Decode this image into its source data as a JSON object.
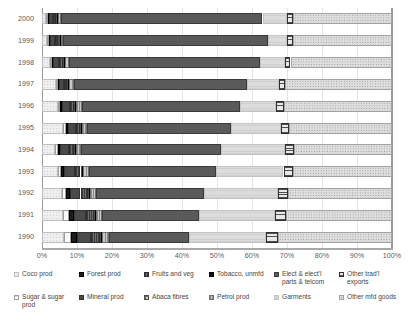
{
  "chart_data": {
    "type": "bar",
    "orientation": "horizontal",
    "stacked": true,
    "stack_mode": "percent",
    "title": "",
    "subtitle": "",
    "xlabel": "",
    "ylabel": "",
    "xlim": [
      0,
      100
    ],
    "xticks": [
      "0%",
      "10%",
      "20%",
      "30%",
      "40%",
      "50%",
      "60%",
      "70%",
      "80%",
      "90%",
      "100%"
    ],
    "xtick_values": [
      0,
      10,
      20,
      30,
      40,
      50,
      60,
      70,
      80,
      90,
      100
    ],
    "grid": true,
    "grid_axis": "x",
    "legend_position": "bottom",
    "legend_columns": 6,
    "categories": [
      "2000",
      "1999",
      "1998",
      "1997",
      "1996",
      "1995",
      "1994",
      "1993",
      "1992",
      "1991",
      "1990"
    ],
    "series": [
      {
        "name": "Coco prod",
        "key": "coco",
        "style": "coco",
        "values": [
          1.2,
          1.5,
          2.2,
          4.0,
          4.6,
          5.9,
          3.7,
          4.6,
          5.7,
          6.0,
          6.3
        ]
      },
      {
        "name": "Sugar & sugar prod",
        "key": "sugar",
        "style": "sugar",
        "values": [
          0.6,
          0.6,
          0.6,
          0.6,
          0.6,
          0.9,
          0.9,
          0.9,
          1.1,
          1.7,
          2.0
        ]
      },
      {
        "name": "Forest prod",
        "key": "forest",
        "style": "forest",
        "values": [
          0.3,
          0.3,
          0.3,
          0.3,
          0.6,
          0.6,
          0.6,
          0.9,
          1.1,
          1.4,
          1.7
        ]
      },
      {
        "name": "Mineral prod",
        "key": "mineral",
        "style": "mineral",
        "values": [
          1.1,
          1.4,
          1.7,
          1.4,
          2.3,
          2.3,
          2.6,
          2.9,
          3.1,
          3.4,
          4.0
        ]
      },
      {
        "name": "Fruits and veg",
        "key": "fruits",
        "style": "fruits",
        "values": [
          0.9,
          0.9,
          1.1,
          0.9,
          1.1,
          1.1,
          1.4,
          1.7,
          2.0,
          2.3,
          2.6
        ]
      },
      {
        "name": "Abaca fibres",
        "key": "abaca",
        "style": "abaca",
        "values": [
          0.3,
          0.3,
          0.3,
          0.3,
          0.3,
          0.3,
          0.3,
          0.3,
          0.3,
          0.3,
          0.3
        ]
      },
      {
        "name": "Tobacco, unmfd",
        "key": "tobacco",
        "style": "tobacco",
        "values": [
          0.3,
          0.3,
          0.3,
          0.3,
          0.3,
          0.3,
          0.3,
          0.3,
          0.3,
          0.3,
          0.3
        ]
      },
      {
        "name": "Petrol prod",
        "key": "petrol",
        "style": "petrol",
        "values": [
          0.6,
          0.6,
          1.1,
          1.4,
          1.7,
          1.4,
          1.4,
          1.7,
          1.7,
          1.7,
          2.0
        ]
      },
      {
        "name": "Elect & elect'l parts & telcom",
        "key": "elect",
        "style": "elect",
        "values": [
          57.7,
          58.6,
          54.6,
          49.4,
          45.1,
          41.1,
          40.0,
          36.3,
          31.1,
          27.7,
          22.9
        ]
      },
      {
        "name": "Garments",
        "key": "garments",
        "style": "garments",
        "values": [
          7.1,
          5.4,
          7.1,
          9.1,
          10.3,
          14.3,
          18.3,
          19.4,
          21.1,
          21.7,
          22.0
        ]
      },
      {
        "name": "Other trad'l exports",
        "key": "othertrad",
        "style": "othertrad",
        "values": [
          1.7,
          1.7,
          1.7,
          1.7,
          2.3,
          2.3,
          2.6,
          2.6,
          2.9,
          3.1,
          3.4
        ]
      },
      {
        "name": "Other mfd goods",
        "key": "othermfd",
        "style": "othermfd",
        "values": [
          28.2,
          28.4,
          29.0,
          30.6,
          30.8,
          29.5,
          27.9,
          28.4,
          29.6,
          30.4,
          32.5
        ]
      }
    ]
  },
  "axes": {
    "y_categories": [
      "2000",
      "1999",
      "1998",
      "1997",
      "1996",
      "1995",
      "1994",
      "1993",
      "1992",
      "1991",
      "1990"
    ],
    "x_ticks": [
      "0%",
      "10%",
      "20%",
      "30%",
      "40%",
      "50%",
      "60%",
      "70%",
      "80%",
      "90%",
      "100%"
    ]
  },
  "legend": {
    "items": [
      {
        "label": "Coco prod",
        "style": "coco"
      },
      {
        "label": "Sugar & sugar prod",
        "style": "sugar"
      },
      {
        "label": "Forest prod",
        "style": "forest"
      },
      {
        "label": "Mineral prod",
        "style": "mineral"
      },
      {
        "label": "Fruits and veg",
        "style": "fruits"
      },
      {
        "label": "Abaca fibres",
        "style": "abaca"
      },
      {
        "label": "Tobacco, unmfd",
        "style": "tobacco"
      },
      {
        "label": "Petrol prod",
        "style": "petrol"
      },
      {
        "label": "Elect & elect'l parts & telcom",
        "style": "elect"
      },
      {
        "label": "Garments",
        "style": "garments"
      },
      {
        "label": "Other trad'l exports",
        "style": "othertrad"
      },
      {
        "label": "Other mfd goods",
        "style": "othermfd"
      }
    ]
  },
  "colors": {
    "background": "#ffffff",
    "axis": "#9a9a9a",
    "gridline": "#e4e4e4",
    "tick_text": "#5e5e5e",
    "legend_text": "#464646"
  }
}
